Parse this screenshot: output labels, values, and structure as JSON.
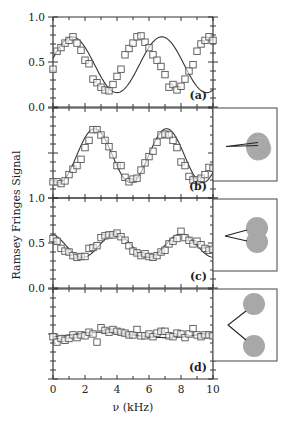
{
  "chart_data": {
    "type": "scatter",
    "title": "",
    "xlabel": "ν (kHz)",
    "ylabel": "Ramsey Fringes Signal",
    "xlim": [
      0,
      10
    ],
    "x_ticks": [
      0,
      2,
      4,
      6,
      8,
      10
    ],
    "y_tick_labels": [
      "1.0",
      "0.5",
      "0.0",
      "1.0",
      "0.5",
      "0.0"
    ],
    "grid": false,
    "panels": [
      {
        "label": "(a)",
        "ylim": [
          0,
          1
        ],
        "y_ticks_labeled": true,
        "fit": {
          "type": "cosine",
          "offset": 0.47,
          "amplitude": 0.31,
          "period_khz": 5.6,
          "phase_peak_khz": 1.2
        },
        "points": [
          [
            0,
            0.42
          ],
          [
            0.25,
            0.62
          ],
          [
            0.5,
            0.66
          ],
          [
            0.75,
            0.71
          ],
          [
            1.0,
            0.74
          ],
          [
            1.25,
            0.78
          ],
          [
            1.5,
            0.71
          ],
          [
            1.75,
            0.63
          ],
          [
            2.0,
            0.52
          ],
          [
            2.25,
            0.48
          ],
          [
            2.5,
            0.31
          ],
          [
            2.75,
            0.27
          ],
          [
            3.0,
            0.22
          ],
          [
            3.25,
            0.19
          ],
          [
            3.5,
            0.18
          ],
          [
            3.75,
            0.25
          ],
          [
            4.0,
            0.34
          ],
          [
            4.25,
            0.42
          ],
          [
            4.5,
            0.58
          ],
          [
            4.75,
            0.65
          ],
          [
            5.0,
            0.71
          ],
          [
            5.25,
            0.78
          ],
          [
            5.5,
            0.79
          ],
          [
            5.75,
            0.72
          ],
          [
            6.0,
            0.66
          ],
          [
            6.25,
            0.58
          ],
          [
            6.5,
            0.52
          ],
          [
            6.75,
            0.45
          ],
          [
            7.0,
            0.36
          ],
          [
            7.25,
            0.22
          ],
          [
            7.5,
            0.25
          ],
          [
            7.75,
            0.19
          ],
          [
            8.0,
            0.23
          ],
          [
            8.25,
            0.31
          ],
          [
            8.5,
            0.4
          ],
          [
            8.75,
            0.47
          ],
          [
            9.0,
            0.62
          ],
          [
            9.25,
            0.7
          ],
          [
            9.5,
            0.74
          ],
          [
            9.75,
            0.78
          ],
          [
            10.0,
            0.74
          ]
        ]
      },
      {
        "label": "(b)",
        "ylim": [
          0,
          1
        ],
        "y_ticks_labeled": false,
        "fit": {
          "type": "cosine",
          "offset": 0.47,
          "amplitude": 0.3,
          "period_khz": 4.5,
          "phase_peak_khz": 2.6
        },
        "points": [
          [
            0,
            0.18
          ],
          [
            0.25,
            0.18
          ],
          [
            0.5,
            0.16
          ],
          [
            0.75,
            0.19
          ],
          [
            1.0,
            0.26
          ],
          [
            1.25,
            0.32
          ],
          [
            1.5,
            0.36
          ],
          [
            1.75,
            0.43
          ],
          [
            2.0,
            0.56
          ],
          [
            2.25,
            0.64
          ],
          [
            2.5,
            0.76
          ],
          [
            2.75,
            0.76
          ],
          [
            3.0,
            0.7
          ],
          [
            3.25,
            0.64
          ],
          [
            3.5,
            0.57
          ],
          [
            3.75,
            0.48
          ],
          [
            4.0,
            0.36
          ],
          [
            4.25,
            0.36
          ],
          [
            4.5,
            0.23
          ],
          [
            4.75,
            0.18
          ],
          [
            5.0,
            0.21
          ],
          [
            5.25,
            0.22
          ],
          [
            5.5,
            0.31
          ],
          [
            5.75,
            0.39
          ],
          [
            6.0,
            0.46
          ],
          [
            6.25,
            0.52
          ],
          [
            6.5,
            0.62
          ],
          [
            6.75,
            0.7
          ],
          [
            7.0,
            0.71
          ],
          [
            7.25,
            0.7
          ],
          [
            7.5,
            0.64
          ],
          [
            7.75,
            0.56
          ],
          [
            8.0,
            0.4
          ],
          [
            8.25,
            0.36
          ],
          [
            8.5,
            0.24
          ],
          [
            8.75,
            0.2
          ],
          [
            9.0,
            0.2
          ],
          [
            9.25,
            0.22
          ],
          [
            9.5,
            0.26
          ],
          [
            9.75,
            0.34
          ],
          [
            10.0,
            0.33
          ]
        ]
      },
      {
        "label": "(c)",
        "ylim": [
          0,
          1
        ],
        "y_ticks_labeled": true,
        "fit": {
          "type": "cosine",
          "offset": 0.47,
          "amplitude": 0.13,
          "period_khz": 4.1,
          "phase_peak_khz": 3.9
        },
        "points": [
          [
            0,
            0.55
          ],
          [
            0.25,
            0.52
          ],
          [
            0.5,
            0.44
          ],
          [
            0.75,
            0.41
          ],
          [
            1.0,
            0.4
          ],
          [
            1.25,
            0.36
          ],
          [
            1.5,
            0.34
          ],
          [
            1.75,
            0.35
          ],
          [
            2.0,
            0.35
          ],
          [
            2.25,
            0.44
          ],
          [
            2.5,
            0.45
          ],
          [
            2.75,
            0.47
          ],
          [
            3.0,
            0.56
          ],
          [
            3.25,
            0.58
          ],
          [
            3.5,
            0.59
          ],
          [
            3.75,
            0.59
          ],
          [
            4.0,
            0.61
          ],
          [
            4.25,
            0.57
          ],
          [
            4.5,
            0.53
          ],
          [
            4.75,
            0.47
          ],
          [
            5.0,
            0.41
          ],
          [
            5.25,
            0.39
          ],
          [
            5.5,
            0.36
          ],
          [
            5.75,
            0.38
          ],
          [
            6.0,
            0.35
          ],
          [
            6.25,
            0.34
          ],
          [
            6.5,
            0.36
          ],
          [
            6.75,
            0.4
          ],
          [
            7.0,
            0.42
          ],
          [
            7.25,
            0.49
          ],
          [
            7.5,
            0.52
          ],
          [
            7.75,
            0.55
          ],
          [
            8.0,
            0.63
          ],
          [
            8.25,
            0.56
          ],
          [
            8.5,
            0.53
          ],
          [
            8.75,
            0.49
          ],
          [
            9.0,
            0.52
          ],
          [
            9.25,
            0.48
          ],
          [
            9.5,
            0.44
          ],
          [
            9.75,
            0.42
          ],
          [
            10.0,
            0.43
          ]
        ]
      },
      {
        "label": "(d)",
        "ylim": [
          0,
          1
        ],
        "y_ticks_labeled": false,
        "fit": {
          "type": "cosine",
          "offset": 0.49,
          "amplitude": 0.03,
          "period_khz": 8.0,
          "phase_peak_khz": 3.0
        },
        "points": [
          [
            0,
            0.47
          ],
          [
            0.25,
            0.41
          ],
          [
            0.5,
            0.45
          ],
          [
            0.75,
            0.43
          ],
          [
            1.0,
            0.45
          ],
          [
            1.25,
            0.49
          ],
          [
            1.5,
            0.46
          ],
          [
            1.75,
            0.49
          ],
          [
            2.0,
            0.48
          ],
          [
            2.25,
            0.52
          ],
          [
            2.5,
            0.5
          ],
          [
            2.75,
            0.41
          ],
          [
            3.0,
            0.57
          ],
          [
            3.25,
            0.54
          ],
          [
            3.5,
            0.52
          ],
          [
            3.75,
            0.55
          ],
          [
            4.0,
            0.53
          ],
          [
            4.25,
            0.52
          ],
          [
            4.5,
            0.51
          ],
          [
            4.75,
            0.49
          ],
          [
            5.0,
            0.49
          ],
          [
            5.25,
            0.55
          ],
          [
            5.5,
            0.48
          ],
          [
            5.75,
            0.48
          ],
          [
            6.0,
            0.5
          ],
          [
            6.25,
            0.47
          ],
          [
            6.5,
            0.51
          ],
          [
            6.75,
            0.53
          ],
          [
            7.0,
            0.53
          ],
          [
            7.25,
            0.48
          ],
          [
            7.5,
            0.47
          ],
          [
            7.75,
            0.51
          ],
          [
            8.0,
            0.5
          ],
          [
            8.25,
            0.46
          ],
          [
            8.5,
            0.5
          ],
          [
            8.75,
            0.56
          ],
          [
            9.0,
            0.49
          ],
          [
            9.25,
            0.47
          ],
          [
            9.5,
            0.49
          ],
          [
            9.75,
            0.49
          ],
          [
            10.0,
            0.48
          ]
        ]
      }
    ],
    "insets": [
      {
        "panel": "(b)",
        "description": "two overlapping gray spheres, nearly coincident, narrow wedge lines"
      },
      {
        "panel": "(c)",
        "description": "two gray spheres partially overlapping, wedge lines"
      },
      {
        "panel": "(d)",
        "description": "two separated gray spheres, wide V lines"
      }
    ]
  },
  "colors": {
    "axis": "#333333",
    "marker_edge": "#555555",
    "fit_line": "#333333",
    "sphere_fill": "#a8a8a8",
    "inset_border": "#555555"
  }
}
